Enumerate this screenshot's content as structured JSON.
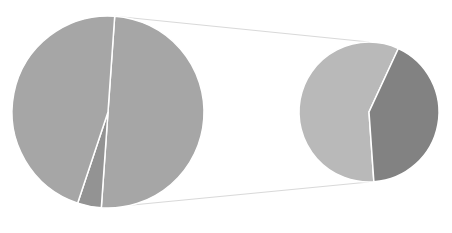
{
  "chart_data": {
    "type": "pie",
    "subtype": "pie-of-pie",
    "title": "",
    "legend": null,
    "main_pie": {
      "center": [
        108,
        112
      ],
      "radius": 96,
      "slices": [
        {
          "name": "Slice A",
          "value": 50,
          "color": "#a6a6a6"
        },
        {
          "name": "Slice B (Other)",
          "value": 4,
          "color": "#939393"
        },
        {
          "name": "Slice C",
          "value": 46,
          "color": "#a6a6a6"
        }
      ]
    },
    "secondary_pie": {
      "center": [
        369,
        112
      ],
      "radius": 70,
      "slices": [
        {
          "name": "Sub 1",
          "value": 58,
          "color": "#b9b9b9"
        },
        {
          "name": "Sub 2",
          "value": 42,
          "color": "#828282"
        }
      ]
    },
    "connector_color": "#d9d9d9",
    "separator_color": "#ffffff"
  }
}
